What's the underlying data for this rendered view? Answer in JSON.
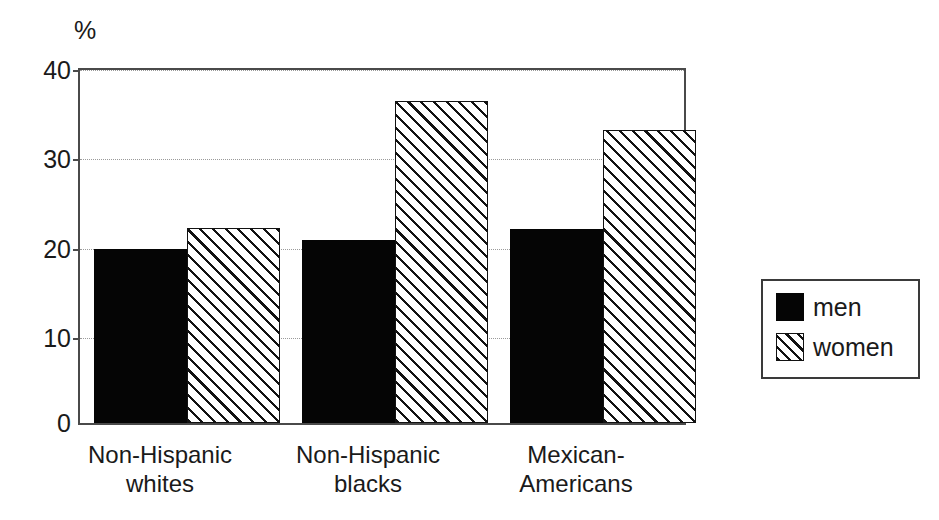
{
  "chart_data": {
    "type": "bar",
    "title": "",
    "subtitle": "",
    "xlabel": "",
    "ylabel": "%",
    "unit_label": "%",
    "categories": [
      "Non-Hispanic whites",
      "Non-Hispanic blacks",
      "Mexican-Americans"
    ],
    "category_lines": [
      [
        "Non-Hispanic",
        "whites"
      ],
      [
        "Non-Hispanic",
        "blacks"
      ],
      [
        "Mexican-",
        "Americans"
      ]
    ],
    "series": [
      {
        "name": "men",
        "values": [
          19.7,
          20.7,
          22.0
        ],
        "fill": "solid-black",
        "color": "#050505"
      },
      {
        "name": "women",
        "values": [
          22.1,
          36.5,
          33.2
        ],
        "fill": "diagonal-hatch",
        "color": "#ffffff"
      }
    ],
    "ylim": [
      0,
      40
    ],
    "yticks": [
      0,
      10,
      20,
      30,
      40
    ],
    "ytick_labels": [
      "0",
      "10",
      "20",
      "30",
      "40"
    ],
    "grid": true,
    "grid_axis": "y",
    "grid_style": "dotted",
    "legend_position": "right-outside",
    "legend_entries": [
      "men",
      "women"
    ]
  },
  "legend": {
    "entries": [
      {
        "label": "men"
      },
      {
        "label": "women"
      }
    ]
  }
}
